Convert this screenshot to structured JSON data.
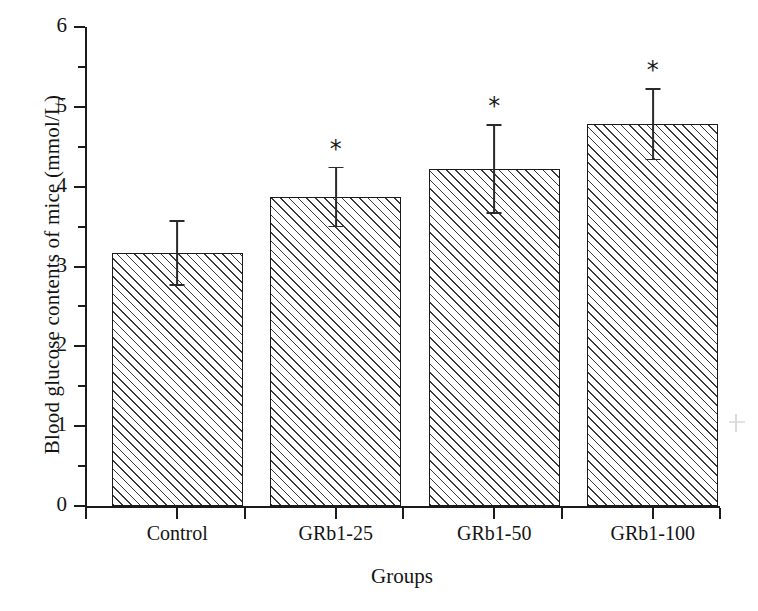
{
  "chart_data": {
    "type": "bar",
    "title": "",
    "xlabel": "Groups",
    "ylabel": "Blood glucose contents of mice (mmol/L)",
    "categories": [
      "Control",
      "GRb1-25",
      "GRb1-50",
      "GRb1-100"
    ],
    "values": [
      3.17,
      3.87,
      4.22,
      4.78
    ],
    "errors": [
      0.4,
      0.37,
      0.55,
      0.44
    ],
    "significance": [
      "",
      "*",
      "*",
      "*"
    ],
    "ylim": [
      0,
      6
    ],
    "ytick_labels": [
      "0",
      "1",
      "2",
      "3",
      "4",
      "5",
      "6"
    ],
    "ytick_values": [
      0,
      1,
      2,
      3,
      4,
      5,
      6
    ],
    "yminor_values": [
      0.5,
      1.5,
      2.5,
      3.5,
      4.5,
      5.5
    ],
    "grid": false,
    "legend": false,
    "bar_fill": "hatched-diagonal",
    "bar_edge_color": "#1b1b1b",
    "error_bar_color": "#2a2a2a",
    "axis_color": "#1b1b1b"
  }
}
